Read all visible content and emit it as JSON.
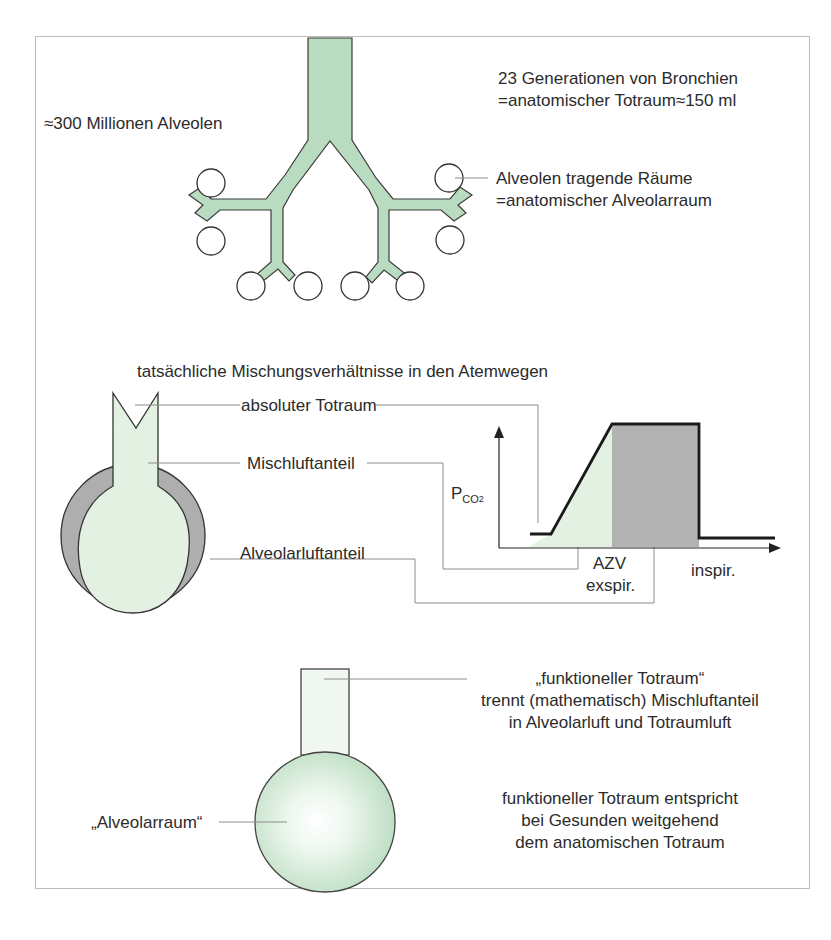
{
  "figure": {
    "colors": {
      "airway_green": "#b9dcc0",
      "mix_green_light": "#e3f1e3",
      "alveolar_gray": "#aeaeae",
      "outline": "#333333",
      "leader_line": "#8c8c8c",
      "frame_border": "#bdbdbd"
    },
    "section_top": {
      "alveoli_count_label": "≈300 Millionen Alveolen",
      "bronchi_label_line1": "23 Generationen von Bronchien",
      "bronchi_label_line2": "=anatomischer Totraum≈150 ml",
      "alveolar_space_line1": "Alveolen tragende Räume",
      "alveolar_space_line2": "=anatomischer Alveolarraum"
    },
    "section_middle": {
      "title": "tatsächliche Mischungsverhältnisse in den Atemwegen",
      "label_absolute_deadspace": "absoluter Totraum",
      "label_mixed_air": "Mischluftanteil",
      "label_alveolar_air": "Alveolarluftanteil",
      "graph": {
        "y_axis_label_main": "P",
        "y_axis_label_sub": "CO",
        "y_axis_label_subsub": "2",
        "x_label_azv": "AZV",
        "x_label_exspir": "exspir.",
        "x_label_inspir": "inspir."
      }
    },
    "section_bottom": {
      "functional_deadspace_title": "„funktioneller Totraum“",
      "functional_line2": "trennt (mathematisch) Mischluftanteil",
      "functional_line3": "in Alveolarluft und Totraumluft",
      "alveolar_space_label": "„Alveolarraum“",
      "note_line1": "funktioneller Totraum entspricht",
      "note_line2": "bei Gesunden weitgehend",
      "note_line3": "dem anatomischen Totraum"
    }
  }
}
